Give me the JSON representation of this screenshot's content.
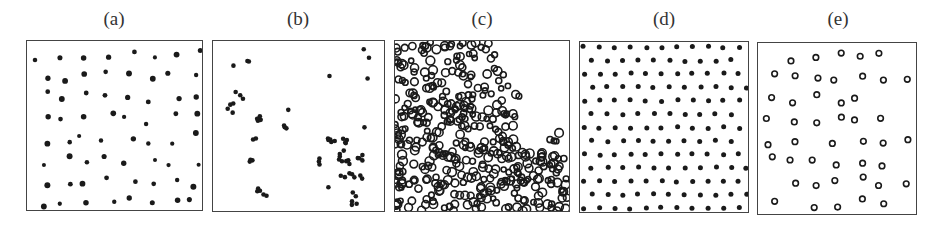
{
  "figure": {
    "panels": [
      {
        "id": "a",
        "label": "(a)",
        "description": "randomly dispersed isolated dots",
        "pattern": "random-dots"
      },
      {
        "id": "b",
        "label": "(b)",
        "description": "dots forming small clusters/chains",
        "pattern": "clustered-dots"
      },
      {
        "id": "c",
        "label": "(c)",
        "description": "dense percolating network with empty region at upper right",
        "pattern": "network"
      },
      {
        "id": "d",
        "label": "(d)",
        "description": "ordered hexagonal lattice of dots",
        "pattern": "lattice-dots"
      },
      {
        "id": "e",
        "label": "(e)",
        "description": "dispersed ring-shaped particles",
        "pattern": "rings"
      }
    ],
    "colors": {
      "ink": "#1a1a1a",
      "border": "#444444",
      "background": "#ffffff"
    }
  }
}
